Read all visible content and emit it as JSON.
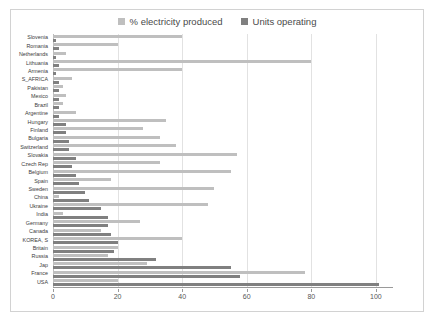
{
  "chart_data": {
    "type": "bar",
    "orientation": "horizontal",
    "title": "",
    "subtitle": "",
    "xlabel": "",
    "ylabel": "",
    "xlim": [
      0,
      105
    ],
    "xticks": [
      0,
      20,
      40,
      60,
      80,
      100
    ],
    "grid": true,
    "legend_position": "top-center",
    "colors": {
      "pct_electricity": "#bfbfbf",
      "units_operating": "#808080",
      "gridline": "#e2e2e2",
      "axis": "#9a9a9a",
      "border": "#d2d2d2",
      "text": "#3d3d3d"
    },
    "legend": [
      "% electricity produced",
      "Units operating"
    ],
    "categories": [
      "Slovenia",
      "Romania",
      "Netherlands",
      "Lithuania",
      "Armenia",
      "S_AFRICA",
      "Pakistan",
      "Mexico",
      "Brazil",
      "Argentine",
      "Hungary",
      "Finland",
      "Bulgaria",
      "Switzerland",
      "Slovakia",
      "Czech Rep",
      "Belgium",
      "Spain",
      "Sweden",
      "China",
      "Ukraine",
      "India",
      "Germany",
      "Canada",
      "KOREA, S",
      "Britain",
      "Russia",
      "Jap",
      "France",
      "USA"
    ],
    "series": [
      {
        "name": "% electricity produced",
        "values": [
          40,
          20,
          4,
          80,
          40,
          6,
          3,
          4,
          3,
          7,
          35,
          28,
          33,
          38,
          57,
          33,
          55,
          18,
          50,
          2,
          48,
          3,
          27,
          15,
          40,
          20,
          17,
          29,
          78,
          20
        ]
      },
      {
        "name": "Units operating",
        "values": [
          1,
          2,
          1,
          2,
          1,
          2,
          2,
          2,
          2,
          2,
          4,
          4,
          5,
          5,
          7,
          6,
          7,
          8,
          10,
          11,
          15,
          17,
          17,
          18,
          20,
          19,
          32,
          55,
          58,
          101
        ]
      }
    ]
  }
}
